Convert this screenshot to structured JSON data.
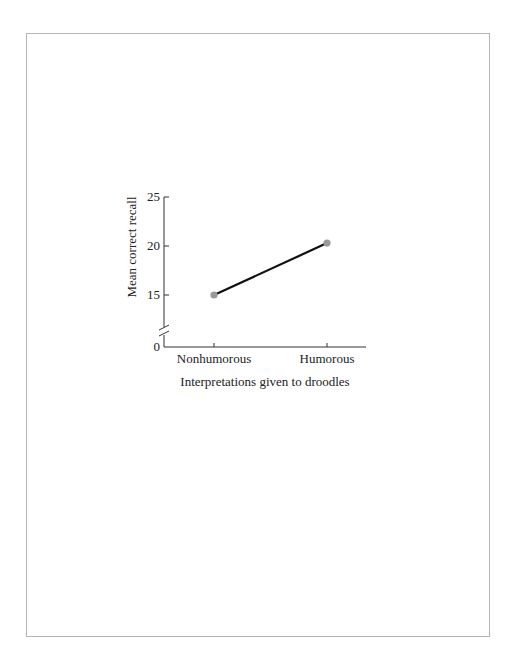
{
  "chart_data": {
    "type": "line",
    "title": "",
    "xlabel": "Interpretations given to droodles",
    "ylabel": "Mean correct recall",
    "categories": [
      "Nonhumorous",
      "Humorous"
    ],
    "series": [
      {
        "name": "Mean correct recall",
        "values": [
          15.0,
          20.3
        ]
      }
    ],
    "ylim": [
      0,
      25
    ],
    "y_ticks": [
      "0",
      "15",
      "20",
      "25"
    ],
    "y_axis_break": true,
    "grid": false,
    "legend": "none",
    "colors": {
      "line": "#111111",
      "marker": "#9a9a9a",
      "axis": "#333333",
      "frame": "#b5b5b5"
    }
  }
}
